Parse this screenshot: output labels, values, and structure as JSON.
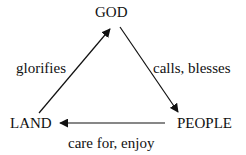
{
  "diagram": {
    "nodes": {
      "god": "GOD",
      "land": "LAND",
      "people": "PEOPLE"
    },
    "edges": [
      {
        "from": "GOD",
        "to": "PEOPLE",
        "label": "calls, blesses"
      },
      {
        "from": "PEOPLE",
        "to": "LAND",
        "label": "care for, enjoy"
      },
      {
        "from": "LAND",
        "to": "GOD",
        "label": "glorifies"
      }
    ]
  }
}
